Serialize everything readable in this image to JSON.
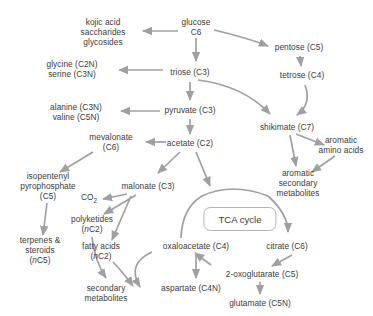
{
  "diagram": {
    "type": "metabolic-pathway-flow-diagram",
    "background_color": "#ffffff",
    "text_color": "#3a3a3a",
    "arrow_color": "#a0a0a0",
    "tca_box_border_color": "#b4b4b4"
  },
  "nodes": [
    {
      "id": "kojic",
      "label": "kojic acid\nsaccharides\nglycosides",
      "x": 103,
      "y": 32
    },
    {
      "id": "glucose",
      "label": "glucose\nC6",
      "x": 196,
      "y": 27
    },
    {
      "id": "pentose",
      "label": "pentose (C5)",
      "x": 299,
      "y": 47
    },
    {
      "id": "glycine",
      "label": "glycine (C2N)\nserine (C3N)",
      "x": 72,
      "y": 69
    },
    {
      "id": "triose",
      "label": "triose (C3)",
      "x": 190,
      "y": 72
    },
    {
      "id": "tetrose",
      "label": "tetrose (C4)",
      "x": 302,
      "y": 75
    },
    {
      "id": "alanine",
      "label": "alanine (C3N)\nvaline (C5N)",
      "x": 76,
      "y": 112
    },
    {
      "id": "pyruvate",
      "label": "pyruvate (C3)",
      "x": 190,
      "y": 110
    },
    {
      "id": "shikimate",
      "label": "shikimate (C7)",
      "x": 287,
      "y": 127
    },
    {
      "id": "mevalonate",
      "label": "mevalonate\n(C6)",
      "x": 111,
      "y": 142
    },
    {
      "id": "acetate",
      "label": "acetate (C2)",
      "x": 190,
      "y": 143
    },
    {
      "id": "aromatic_aa",
      "label": "aromatic\namino acids",
      "x": 341,
      "y": 145
    },
    {
      "id": "ipp",
      "label": "isopentenyl\npyrophosphate\n(C5)",
      "x": 48,
      "y": 186
    },
    {
      "id": "malonate",
      "label": "malonate (C3)",
      "x": 148,
      "y": 186
    },
    {
      "id": "aromatic_sec",
      "label": "aromatic\nsecondary\nmetabolites",
      "x": 298,
      "y": 183
    },
    {
      "id": "co2",
      "label": "CO2",
      "x": 89,
      "y": 199,
      "has_subscript": true
    },
    {
      "id": "polyketides",
      "label": "polyketides\n(nC2)",
      "x": 92,
      "y": 224,
      "italic_n": true
    },
    {
      "id": "tca",
      "label": "TCA cycle",
      "x": 240,
      "y": 219,
      "boxed": true
    },
    {
      "id": "terpenes",
      "label": "terpenes &\nsteroids\n(nC5)",
      "x": 40,
      "y": 250,
      "italic_n": true
    },
    {
      "id": "fatty",
      "label": "fatty acids\n(nC2)",
      "x": 101,
      "y": 251,
      "italic_n": true
    },
    {
      "id": "oxaloacetate",
      "label": "oxaloacetate (C4)",
      "x": 196,
      "y": 246
    },
    {
      "id": "citrate",
      "label": "citrate (C6)",
      "x": 287,
      "y": 246
    },
    {
      "id": "oxoglutarate",
      "label": "2-oxoglutarate (C5)",
      "x": 262,
      "y": 274
    },
    {
      "id": "aspartate",
      "label": "aspartate (C4N)",
      "x": 191,
      "y": 288
    },
    {
      "id": "secondary",
      "label": "secondary\nmetabolites",
      "x": 106,
      "y": 293
    },
    {
      "id": "glutamate",
      "label": "glutamate (C5N)",
      "x": 260,
      "y": 303
    }
  ],
  "edges": [
    {
      "from": "glucose",
      "to": "kojic",
      "style": "straight"
    },
    {
      "from": "glucose",
      "to": "pentose",
      "style": "curve"
    },
    {
      "from": "glucose",
      "to": "triose",
      "style": "straight"
    },
    {
      "from": "triose",
      "to": "glycine",
      "style": "straight"
    },
    {
      "from": "triose",
      "to": "pyruvate",
      "style": "straight"
    },
    {
      "from": "triose",
      "to": "shikimate",
      "style": "curve"
    },
    {
      "from": "pentose",
      "to": "tetrose",
      "style": "straight"
    },
    {
      "from": "tetrose",
      "to": "shikimate",
      "style": "curve"
    },
    {
      "from": "pyruvate",
      "to": "alanine",
      "style": "straight"
    },
    {
      "from": "pyruvate",
      "to": "acetate",
      "style": "straight"
    },
    {
      "from": "shikimate",
      "to": "aromatic_aa",
      "style": "straight"
    },
    {
      "from": "shikimate",
      "to": "aromatic_sec",
      "style": "straight"
    },
    {
      "from": "aromatic_aa",
      "to": "aromatic_sec",
      "style": "straight"
    },
    {
      "from": "acetate",
      "to": "mevalonate",
      "style": "straight"
    },
    {
      "from": "acetate",
      "to": "malonate",
      "style": "straight"
    },
    {
      "from": "acetate",
      "to": "tca",
      "style": "straight"
    },
    {
      "from": "mevalonate",
      "to": "ipp",
      "style": "straight"
    },
    {
      "from": "malonate",
      "to": "co2",
      "style": "straight"
    },
    {
      "from": "malonate",
      "to": "polyketides",
      "style": "straight"
    },
    {
      "from": "malonate",
      "to": "fatty",
      "style": "straight"
    },
    {
      "from": "ipp",
      "to": "terpenes",
      "style": "straight"
    },
    {
      "from": "polyketides",
      "to": "secondary",
      "style": "curve"
    },
    {
      "from": "fatty",
      "to": "secondary",
      "style": "curve"
    },
    {
      "from": "oxaloacetate",
      "to": "secondary",
      "style": "curve"
    },
    {
      "from": "oxaloacetate",
      "to": "aspartate",
      "style": "straight"
    },
    {
      "from": "oxaloacetate",
      "to": "tca_arc_top",
      "style": "arc"
    },
    {
      "from": "tca_arc",
      "to": "citrate",
      "style": "arc"
    },
    {
      "from": "citrate",
      "to": "oxoglutarate",
      "style": "straight"
    },
    {
      "from": "oxoglutarate",
      "to": "oxaloacetate",
      "style": "straight"
    },
    {
      "from": "oxoglutarate",
      "to": "glutamate",
      "style": "straight"
    }
  ]
}
